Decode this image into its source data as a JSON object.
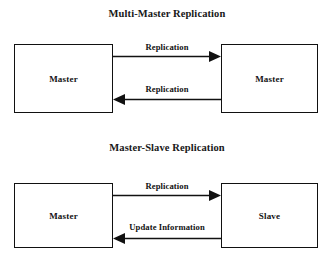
{
  "diagrams": [
    {
      "title": "Multi-Master Replication",
      "left_node": "Master",
      "right_node": "Master",
      "forward_label": "Replication",
      "return_label": "Replication"
    },
    {
      "title": "Master-Slave Replication",
      "left_node": "Master",
      "right_node": "Slave",
      "forward_label": "Replication",
      "return_label": "Update Information"
    }
  ],
  "colors": {
    "stroke": "#111111",
    "text": "#141414",
    "background": "#ffffff"
  }
}
